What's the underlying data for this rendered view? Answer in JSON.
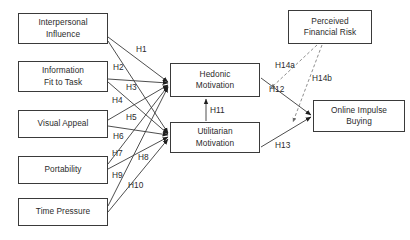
{
  "diagram": {
    "nodes": [
      {
        "id": "interpersonal-influence",
        "label": "Interpersonal\nInfluence",
        "x": 18,
        "y": 13,
        "w": 90,
        "h": 31
      },
      {
        "id": "information-fit-to-task",
        "label": "Information\nFit to Task",
        "x": 18,
        "y": 61,
        "w": 90,
        "h": 31
      },
      {
        "id": "visual-appeal",
        "label": "Visual Appeal",
        "x": 18,
        "y": 110,
        "w": 90,
        "h": 28
      },
      {
        "id": "portability",
        "label": "Portability",
        "x": 18,
        "y": 156,
        "w": 90,
        "h": 28
      },
      {
        "id": "time-pressure",
        "label": "Time Pressure",
        "x": 18,
        "y": 198,
        "w": 90,
        "h": 28
      },
      {
        "id": "hedonic-motivation",
        "label": "Hedonic\nMotivation",
        "x": 170,
        "y": 63,
        "w": 90,
        "h": 34
      },
      {
        "id": "utilitarian-motivation",
        "label": "Utilitarian\nMotivation",
        "x": 170,
        "y": 122,
        "w": 90,
        "h": 31
      },
      {
        "id": "perceived-financial-risk",
        "label": "Perceived\nFinancial Risk",
        "x": 288,
        "y": 10,
        "w": 84,
        "h": 34
      },
      {
        "id": "online-impulse-buying",
        "label": "Online Impulse\nBuying",
        "x": 313,
        "y": 100,
        "w": 92,
        "h": 32
      }
    ],
    "paths": [
      {
        "id": "h1",
        "label": "H1",
        "from": "interpersonal-influence",
        "to": "hedonic-motivation",
        "style": "solid",
        "x1": 108,
        "y1": 37,
        "x2": 168,
        "y2": 82,
        "lx": 136,
        "ly": 44
      },
      {
        "id": "h2",
        "label": "H2",
        "from": "interpersonal-influence",
        "to": "utilitarian-motivation",
        "style": "solid",
        "x1": 108,
        "y1": 41,
        "x2": 168,
        "y2": 133,
        "lx": 113,
        "ly": 62
      },
      {
        "id": "h3",
        "label": "H3",
        "from": "information-fit-to-task",
        "to": "hedonic-motivation",
        "style": "solid",
        "x1": 108,
        "y1": 79,
        "x2": 168,
        "y2": 83,
        "lx": 126,
        "ly": 82
      },
      {
        "id": "h4",
        "label": "H4",
        "from": "information-fit-to-task",
        "to": "utilitarian-motivation",
        "style": "solid",
        "x1": 108,
        "y1": 82,
        "x2": 168,
        "y2": 134,
        "lx": 112,
        "ly": 95
      },
      {
        "id": "h5",
        "label": "H5",
        "from": "visual-appeal",
        "to": "hedonic-motivation",
        "style": "solid",
        "x1": 108,
        "y1": 120,
        "x2": 168,
        "y2": 85,
        "lx": 126,
        "ly": 112
      },
      {
        "id": "h6",
        "label": "H6",
        "from": "visual-appeal",
        "to": "utilitarian-motivation",
        "style": "solid",
        "x1": 108,
        "y1": 126,
        "x2": 168,
        "y2": 135,
        "lx": 113,
        "ly": 131
      },
      {
        "id": "h7",
        "label": "H7",
        "from": "portability",
        "to": "hedonic-motivation",
        "style": "solid",
        "x1": 108,
        "y1": 164,
        "x2": 168,
        "y2": 86,
        "lx": 112,
        "ly": 148
      },
      {
        "id": "h8",
        "label": "H8",
        "from": "portability",
        "to": "utilitarian-motivation",
        "style": "solid",
        "x1": 108,
        "y1": 169,
        "x2": 168,
        "y2": 137,
        "lx": 138,
        "ly": 152
      },
      {
        "id": "h9",
        "label": "H9",
        "from": "time-pressure",
        "to": "hedonic-motivation",
        "style": "solid",
        "x1": 108,
        "y1": 206,
        "x2": 168,
        "y2": 87,
        "lx": 112,
        "ly": 170
      },
      {
        "id": "h10",
        "label": "H10",
        "from": "time-pressure",
        "to": "utilitarian-motivation",
        "style": "solid",
        "x1": 108,
        "y1": 212,
        "x2": 168,
        "y2": 139,
        "lx": 128,
        "ly": 180
      },
      {
        "id": "h11",
        "label": "H11",
        "from": "utilitarian-motivation",
        "to": "hedonic-motivation",
        "style": "solid",
        "x1": 206,
        "y1": 121,
        "x2": 206,
        "y2": 99,
        "lx": 210,
        "ly": 105
      },
      {
        "id": "h12",
        "label": "H12",
        "from": "hedonic-motivation",
        "to": "online-impulse-buying",
        "style": "solid",
        "x1": 261,
        "y1": 78,
        "x2": 311,
        "y2": 115,
        "lx": 269,
        "ly": 84
      },
      {
        "id": "h13",
        "label": "H13",
        "from": "utilitarian-motivation",
        "to": "online-impulse-buying",
        "style": "solid",
        "x1": 261,
        "y1": 147,
        "x2": 311,
        "y2": 117,
        "lx": 275,
        "ly": 140
      },
      {
        "id": "h14a",
        "label": "H14a",
        "from": "perceived-financial-risk",
        "to": "h12-path",
        "style": "dashed",
        "x1": 317,
        "y1": 45,
        "x2": 271,
        "y2": 88,
        "lx": 275,
        "ly": 60
      },
      {
        "id": "h14b",
        "label": "H14b",
        "from": "perceived-financial-risk",
        "to": "h13-path",
        "style": "dashed",
        "x1": 322,
        "y1": 45,
        "x2": 293,
        "y2": 122,
        "lx": 312,
        "ly": 73
      }
    ],
    "colors": {
      "stroke": "#3a3a3a",
      "text": "#2b2b2b",
      "background": "#ffffff"
    }
  }
}
